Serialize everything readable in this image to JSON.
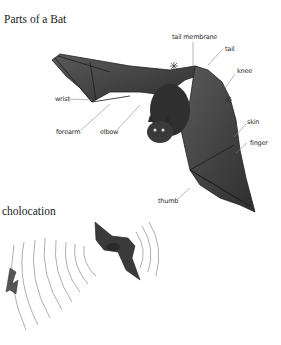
{
  "sections": {
    "parts": {
      "title": "Parts of a Bat",
      "labels": {
        "tail_membrane": "tail membrane",
        "tail": "tail",
        "knee": "knee",
        "wrist": "wrist",
        "forearm": "forearm",
        "elbow": "elbow",
        "skin": "skin",
        "finger": "finger",
        "thumb": "thumb"
      }
    },
    "echolocation": {
      "title": "cholocation"
    }
  },
  "colors": {
    "ink": "#2a2a2a",
    "bat_body": "#3a3a3a",
    "membrane": "#555555",
    "leader": "#888888",
    "waves": "#9a9a9a"
  }
}
